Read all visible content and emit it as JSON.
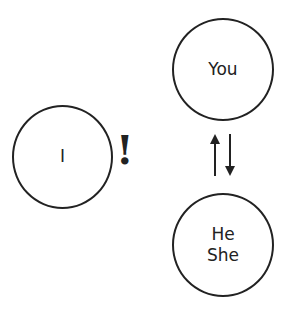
{
  "nodes": {
    "i": {
      "label": "I"
    },
    "you": {
      "label": "You"
    },
    "he_she": {
      "lines": [
        "He",
        "She"
      ]
    }
  },
  "annotations": {
    "exclamation": "!",
    "exchange_arrows": "up-down"
  },
  "colors": {
    "stroke": "#222222",
    "background": "#ffffff"
  }
}
